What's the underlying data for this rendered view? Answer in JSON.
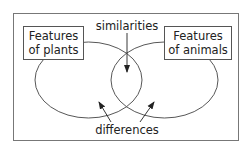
{
  "diagram": {
    "type": "venn",
    "left_set": {
      "label_line1": "Features",
      "label_line2": "of plants"
    },
    "right_set": {
      "label_line1": "Features",
      "label_line2": "of animals"
    },
    "overlap_label": "similarities",
    "outer_label": "differences"
  }
}
